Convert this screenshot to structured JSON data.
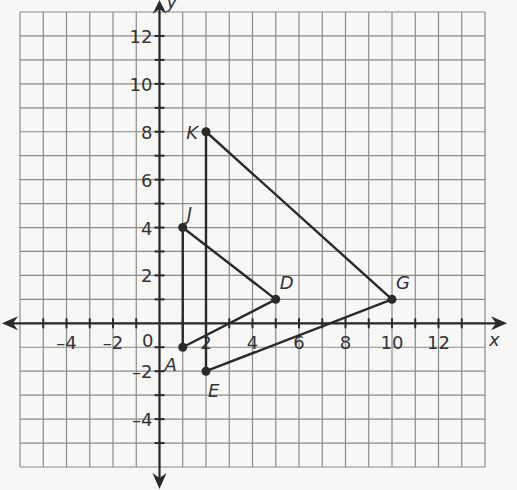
{
  "chart_data": {
    "type": "scatter",
    "title": "",
    "xlabel": "x",
    "ylabel": "y",
    "xlim": [
      -6,
      14
    ],
    "ylim": [
      -6,
      13
    ],
    "grid": true,
    "x_ticks": [
      -4,
      -2,
      2,
      4,
      6,
      8,
      10,
      12
    ],
    "y_ticks": [
      -4,
      -2,
      2,
      4,
      6,
      8,
      10,
      12
    ],
    "origin_label": "0",
    "points": [
      {
        "label": "A",
        "x": 1,
        "y": -1
      },
      {
        "label": "D",
        "x": 5,
        "y": 1
      },
      {
        "label": "J",
        "x": 1,
        "y": 4
      },
      {
        "label": "E",
        "x": 2,
        "y": -2
      },
      {
        "label": "G",
        "x": 10,
        "y": 1
      },
      {
        "label": "K",
        "x": 2,
        "y": 8
      }
    ],
    "triangles": [
      {
        "name": "triangle-ADJ",
        "vertices": [
          "A",
          "D",
          "J"
        ]
      },
      {
        "name": "triangle-EGK",
        "vertices": [
          "E",
          "G",
          "K"
        ]
      }
    ]
  },
  "colors": {
    "grid": "#8a8a8a",
    "axis": "#2a2a2a",
    "shape": "#2a2a2a",
    "background": "#f7f7f5"
  }
}
